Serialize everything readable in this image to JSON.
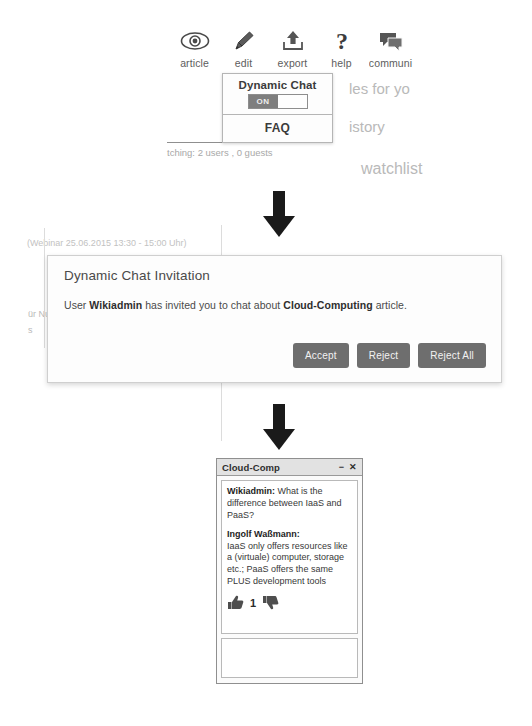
{
  "background": {
    "fragments": [
      {
        "text": "les for yo",
        "x": 349,
        "y": 88,
        "size": 15
      },
      {
        "text": "istory",
        "x": 349,
        "y": 126,
        "size": 15
      },
      {
        "text": "watchlist",
        "x": 361,
        "y": 167,
        "size": 16
      },
      {
        "text": "tching: 2 users , 0 guests",
        "x": 167,
        "y": 149,
        "size": 9.5
      },
      {
        "text": "(Webinar 25.06.2015 13:30 - 15:00 Uhr)",
        "x": 27,
        "y": 241,
        "size": 9
      },
      {
        "text": "ür Nu",
        "x": 28,
        "y": 312,
        "size": 9
      },
      {
        "text": "s",
        "x": 28,
        "y": 328,
        "size": 9
      }
    ]
  },
  "toolbar": {
    "items": [
      {
        "label": "article",
        "icon": "eye-icon"
      },
      {
        "label": "edit",
        "icon": "pencil-icon"
      },
      {
        "label": "export",
        "icon": "upload-icon"
      },
      {
        "label": "help",
        "icon": "question-mark-icon"
      },
      {
        "label": "communi",
        "icon": "speech-bubbles-icon"
      }
    ]
  },
  "dropdown": {
    "title": "Dynamic Chat",
    "toggle_label": "ON",
    "toggle_state": "on",
    "faq_label": "FAQ"
  },
  "dialog": {
    "title": "Dynamic Chat Invitation",
    "message_prefix": "User ",
    "message_user": "Wikiadmin",
    "message_middle": " has invited you to chat about ",
    "message_article": "Cloud-Computing",
    "message_suffix": " article.",
    "buttons": {
      "accept": "Accept",
      "reject": "Reject",
      "reject_all": "Reject All"
    }
  },
  "chat_window": {
    "title": "Cloud-Comp",
    "minimize_glyph": "−",
    "close_glyph": "✕",
    "messages": [
      {
        "author": "Wikiadmin:",
        "text": " What is the difference between IaaS and PaaS?"
      },
      {
        "author": "Ingolf Waßmann:",
        "text": "IaaS only offers resources like a (virtuale) computer, storage etc.; PaaS offers the same PLUS development tools"
      }
    ],
    "votes": {
      "up_icon": "thumbs-up-icon",
      "count": "1",
      "down_icon": "thumbs-down-icon"
    },
    "input_placeholder": ""
  },
  "flow": {
    "arrow_1": "down-arrow",
    "arrow_2": "down-arrow"
  },
  "colors": {
    "page_bg": "#ffffff",
    "button_bg": "#6e6e6e",
    "toggle_on_bg": "#7e7e7e",
    "chat_title_bg": "#e2e2e2",
    "faint_text": "#b9b9b9"
  }
}
